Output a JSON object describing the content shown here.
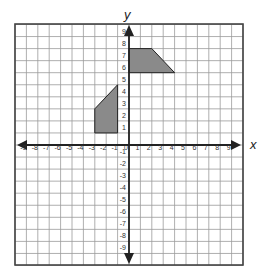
{
  "diagram": {
    "type": "coordinate-grid",
    "axes": {
      "x_label": "x",
      "y_label": "y",
      "x_range": [
        -9,
        9
      ],
      "y_range": [
        -9,
        9
      ],
      "x_ticks": [
        "-9",
        "-8",
        "-7",
        "-6",
        "-5",
        "-4",
        "-3",
        "-2",
        "-1",
        "0",
        "1",
        "2",
        "3",
        "4",
        "5",
        "6",
        "7",
        "8",
        "9"
      ],
      "y_ticks": [
        "9",
        "8",
        "7",
        "6",
        "5",
        "4",
        "3",
        "2",
        "1",
        "-1",
        "-2",
        "-3",
        "-4",
        "-5",
        "-6",
        "-7",
        "-8",
        "-9"
      ]
    },
    "shapes": [
      {
        "name": "upper-trapezoid",
        "fill": "#8a8a8a",
        "vertices": [
          [
            0,
            6
          ],
          [
            0,
            8
          ],
          [
            2,
            8
          ],
          [
            4,
            6
          ]
        ]
      },
      {
        "name": "lower-quadrilateral",
        "fill": "#8a8a8a",
        "vertices": [
          [
            -3,
            1
          ],
          [
            -1,
            1
          ],
          [
            -1,
            5
          ],
          [
            -3,
            3
          ]
        ]
      }
    ],
    "colors": {
      "grid_line": "#9a9a9a",
      "border": "#444444",
      "axis": "#222222",
      "label": "#333333"
    }
  }
}
